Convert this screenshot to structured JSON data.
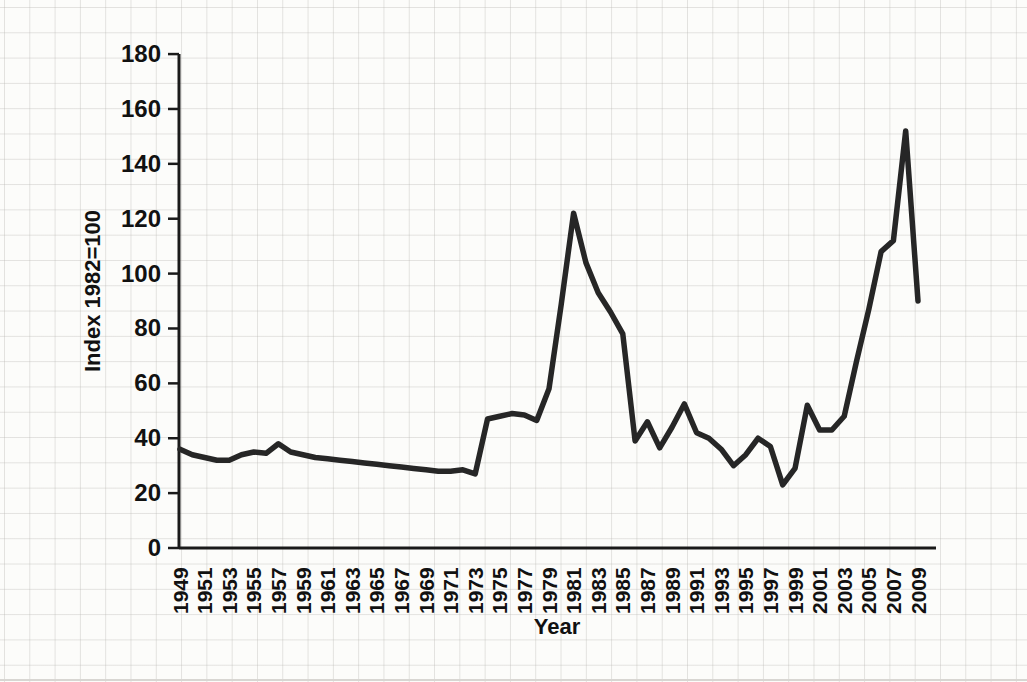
{
  "figure": {
    "background_color": "#fcfcfa",
    "grid_color": "#b9b7b3",
    "axis_color": "#1a1a1a",
    "line_color": "#262626",
    "label_color": "#111111"
  },
  "chart_data": {
    "type": "line",
    "title": "",
    "xlabel": "Year",
    "ylabel": "Index 1982=100",
    "legend": "none",
    "grid": "graph-paper page background only",
    "ylim": [
      0,
      180
    ],
    "y_ticks": [
      0,
      20,
      40,
      60,
      80,
      100,
      120,
      140,
      160,
      180
    ],
    "x_tick_labels": [
      "1949",
      "1951",
      "1953",
      "1955",
      "1957",
      "1959",
      "1961",
      "1963",
      "1965",
      "1967",
      "1969",
      "1971",
      "1973",
      "1975",
      "1977",
      "1979",
      "1981",
      "1983",
      "1985",
      "1987",
      "1989",
      "1991",
      "1993",
      "1995",
      "1997",
      "1999",
      "2001",
      "2003",
      "2005",
      "2007",
      "2009"
    ],
    "x": [
      1949,
      1950,
      1951,
      1952,
      1953,
      1954,
      1955,
      1956,
      1957,
      1958,
      1959,
      1960,
      1961,
      1962,
      1963,
      1964,
      1965,
      1966,
      1967,
      1968,
      1969,
      1970,
      1971,
      1972,
      1973,
      1974,
      1975,
      1976,
      1977,
      1978,
      1979,
      1980,
      1981,
      1982,
      1983,
      1984,
      1985,
      1986,
      1987,
      1988,
      1989,
      1990,
      1991,
      1992,
      1993,
      1994,
      1995,
      1996,
      1997,
      1998,
      1999,
      2000,
      2001,
      2002,
      2003,
      2004,
      2005,
      2006,
      2007,
      2008,
      2009
    ],
    "series": [
      {
        "name": "Index (1982=100)",
        "values": [
          36,
          34,
          33,
          32,
          32,
          34,
          35,
          34.5,
          38,
          35,
          34,
          33,
          32.5,
          32,
          31.5,
          31,
          30.5,
          30,
          29.5,
          29,
          28.5,
          28,
          28,
          28.5,
          27,
          47,
          48,
          49,
          48.5,
          46.5,
          58,
          89,
          122,
          104,
          93,
          86,
          78,
          39,
          46,
          36.5,
          44,
          52.5,
          42,
          40,
          36,
          30,
          34,
          40,
          37,
          23,
          29,
          52,
          43,
          43,
          48,
          68,
          87,
          108,
          112,
          152,
          90
        ]
      }
    ]
  }
}
